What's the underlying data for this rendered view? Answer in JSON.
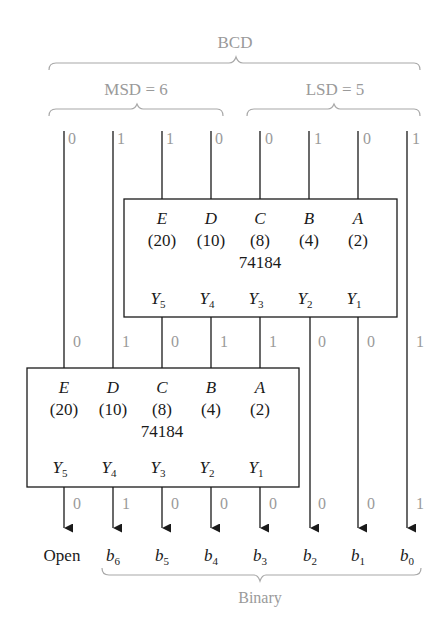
{
  "labels": {
    "bcd": "BCD",
    "msd": "MSD = 6",
    "lsd": "LSD = 5",
    "binary": "Binary",
    "open": "Open"
  },
  "bcd_input_bits": [
    "0",
    "1",
    "1",
    "0",
    "0",
    "1",
    "0",
    "1"
  ],
  "mid_bits": [
    "0",
    "1",
    "0",
    "1",
    "1",
    "0",
    "0",
    "1"
  ],
  "output_bits": [
    "0",
    "1",
    "0",
    "0",
    "0",
    "0",
    "0",
    "1"
  ],
  "output_labels": [
    {
      "base": "b",
      "sub": "6"
    },
    {
      "base": "b",
      "sub": "5"
    },
    {
      "base": "b",
      "sub": "4"
    },
    {
      "base": "b",
      "sub": "3"
    },
    {
      "base": "b",
      "sub": "2"
    },
    {
      "base": "b",
      "sub": "1"
    },
    {
      "base": "b",
      "sub": "0"
    }
  ],
  "chip_upper": {
    "part": "74184",
    "inputs": [
      {
        "name": "E",
        "weight": "(20)"
      },
      {
        "name": "D",
        "weight": "(10)"
      },
      {
        "name": "C",
        "weight": "(8)"
      },
      {
        "name": "B",
        "weight": "(4)"
      },
      {
        "name": "A",
        "weight": "(2)"
      }
    ],
    "outputs": [
      {
        "base": "Y",
        "sub": "5"
      },
      {
        "base": "Y",
        "sub": "4"
      },
      {
        "base": "Y",
        "sub": "3"
      },
      {
        "base": "Y",
        "sub": "2"
      },
      {
        "base": "Y",
        "sub": "1"
      }
    ]
  },
  "chip_lower": {
    "part": "74184",
    "inputs": [
      {
        "name": "E",
        "weight": "(20)"
      },
      {
        "name": "D",
        "weight": "(10)"
      },
      {
        "name": "C",
        "weight": "(8)"
      },
      {
        "name": "B",
        "weight": "(4)"
      },
      {
        "name": "A",
        "weight": "(2)"
      }
    ],
    "outputs": [
      {
        "base": "Y",
        "sub": "5"
      },
      {
        "base": "Y",
        "sub": "4"
      },
      {
        "base": "Y",
        "sub": "3"
      },
      {
        "base": "Y",
        "sub": "2"
      },
      {
        "base": "Y",
        "sub": "1"
      }
    ]
  }
}
